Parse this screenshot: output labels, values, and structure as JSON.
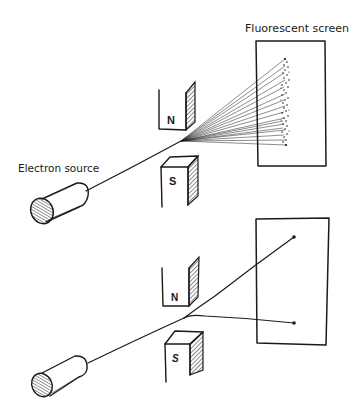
{
  "diagram": {
    "labels": {
      "screen": "Fluorescent screen",
      "source": "Electron source",
      "north_top": "N",
      "south_top": "S",
      "north_bottom": "N",
      "south_bottom": "S"
    },
    "panels": [
      {
        "id": "top",
        "description": "Beam from electron source passes between N and S magnet poles and fans out into a spread of rays hitting the fluorescent screen as a vertical band of dots",
        "components": [
          "electron-source",
          "north-magnet",
          "south-magnet",
          "fan-of-rays",
          "fluorescent-screen",
          "dot-band"
        ]
      },
      {
        "id": "bottom",
        "description": "Beam from electron source passes between N and S magnet poles and splits into two discrete beams, producing two spots on the screen",
        "components": [
          "electron-source",
          "north-magnet",
          "south-magnet",
          "upper-beam",
          "lower-beam",
          "screen",
          "two-spots"
        ]
      }
    ],
    "colors": {
      "ink": "#1a1a1a",
      "background": "#ffffff"
    }
  }
}
